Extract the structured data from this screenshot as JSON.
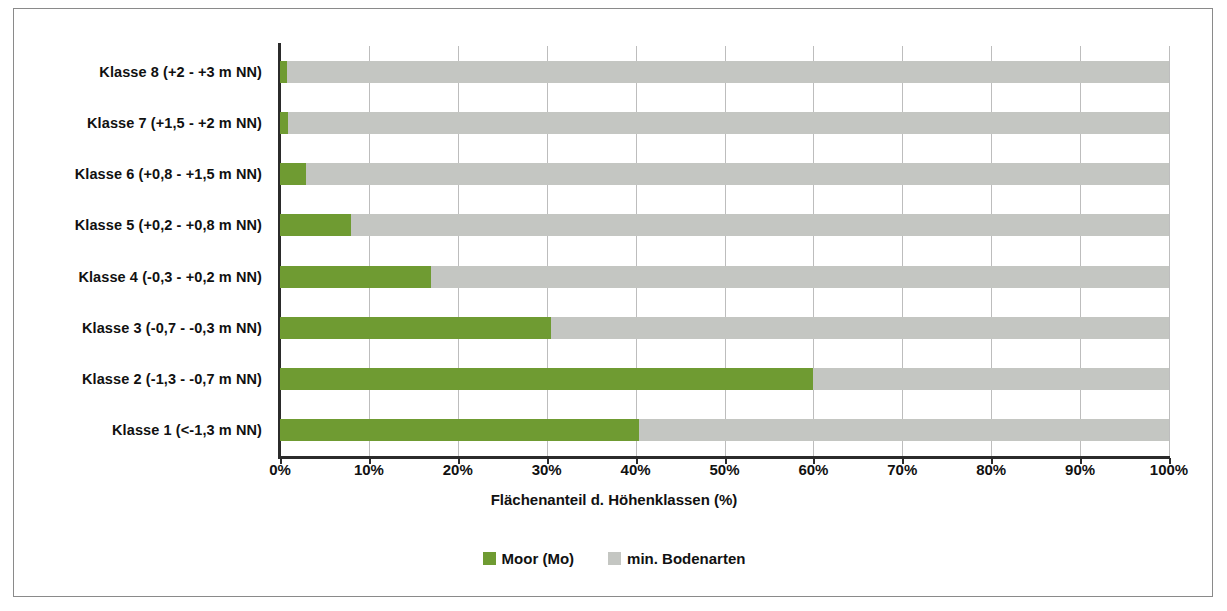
{
  "chart_data": {
    "type": "bar",
    "orientation": "horizontal",
    "stacked": true,
    "stack_total": 100,
    "title": "",
    "xlabel": "Flächenanteil d. Höhenklassen (%)",
    "ylabel": "",
    "xlim": [
      0,
      100
    ],
    "xticks": [
      0,
      10,
      20,
      30,
      40,
      50,
      60,
      70,
      80,
      90,
      100
    ],
    "xtick_labels": [
      "0%",
      "10%",
      "20%",
      "30%",
      "40%",
      "50%",
      "60%",
      "70%",
      "80%",
      "90%",
      "100%"
    ],
    "grid": "vertical",
    "legend_position": "bottom",
    "categories": [
      "Klasse 8 (+2 - +3 m NN)",
      "Klasse 7 (+1,5 - +2 m NN)",
      "Klasse 6 (+0,8 - +1,5 m NN)",
      "Klasse 5 (+0,2 - +0,8 m NN)",
      "Klasse 4 (-0,3 - +0,2 m NN)",
      "Klasse 3 (-0,7 - -0,3 m NN)",
      "Klasse 2 (-1,3 - -0,7 m NN)",
      "Klasse 1 (<-1,3 m NN)"
    ],
    "series": [
      {
        "name": "Moor (Mo)",
        "color": "#6f9b32",
        "values": [
          0.8,
          0.9,
          2.9,
          8.0,
          17.0,
          30.5,
          60.0,
          40.4
        ]
      },
      {
        "name": "min. Bodenarten",
        "color": "#c4c6c2",
        "values": [
          99.2,
          99.1,
          97.1,
          92.0,
          83.0,
          69.5,
          40.0,
          59.6
        ]
      }
    ]
  },
  "legend": {
    "items": [
      {
        "label": "Moor (Mo)",
        "swatch": "moor"
      },
      {
        "label": "min. Bodenarten",
        "swatch": "mineral"
      }
    ]
  },
  "colors": {
    "moor": "#6f9b32",
    "mineral": "#c4c6c2",
    "axis": "#2b2b2b",
    "grid": "#bdbdbd",
    "border": "#8a8a8a",
    "text": "#111111",
    "background": "#ffffff"
  }
}
